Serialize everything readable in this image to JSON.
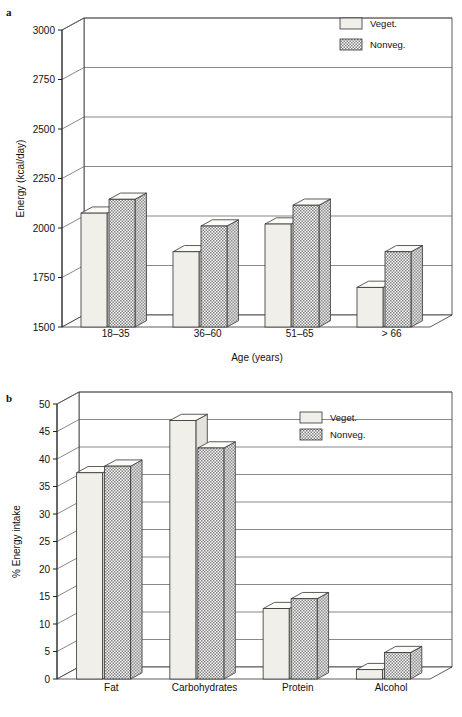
{
  "figures": [
    {
      "id": "a",
      "letter": "a",
      "chart_data": {
        "type": "bar",
        "title": "",
        "xlabel": "Age (years)",
        "ylabel": "Energy (kcal/day)",
        "categories": [
          "18–35",
          "36–60",
          "51–65",
          "> 66"
        ],
        "ylim": [
          1500,
          3000
        ],
        "yticks": [
          1500,
          1750,
          2000,
          2250,
          2500,
          2750,
          3000
        ],
        "ytick_labels": [
          "1500",
          "1750",
          "2000",
          "2250",
          "2500",
          "2750",
          "3000"
        ],
        "grid": true,
        "legend_position": "top-right",
        "series": [
          {
            "name": "Veget.",
            "values": [
              2075,
              1880,
              2020,
              1700
            ]
          },
          {
            "name": "Nonveg.",
            "values": [
              2145,
              2010,
              2115,
              1880
            ]
          }
        ]
      }
    },
    {
      "id": "b",
      "letter": "b",
      "chart_data": {
        "type": "bar",
        "title": "",
        "xlabel": "",
        "ylabel": "% Energy intake",
        "categories": [
          "Fat",
          "Carbohydrates",
          "Protein",
          "Alcohol"
        ],
        "ylim": [
          0,
          50
        ],
        "yticks": [
          0,
          5,
          10,
          15,
          20,
          25,
          30,
          35,
          40,
          45,
          50
        ],
        "ytick_labels": [
          "0",
          "5",
          "10",
          "15",
          "20",
          "25",
          "30",
          "35",
          "40",
          "45",
          "50"
        ],
        "grid": true,
        "legend_position": "top-right",
        "series": [
          {
            "name": "Veget.",
            "values": [
              37.5,
              47.0,
              12.8,
              1.7
            ]
          },
          {
            "name": "Nonveg.",
            "values": [
              38.7,
              42.0,
              14.6,
              4.8
            ]
          }
        ]
      }
    }
  ],
  "legend": {
    "veget_label": "Veget.",
    "nonveg_label": "Nonveg."
  },
  "colors": {
    "veget_fill": "#f0efea",
    "nonveg_fill": "#9a9a9a",
    "line": "#333333",
    "background": "#ffffff"
  }
}
